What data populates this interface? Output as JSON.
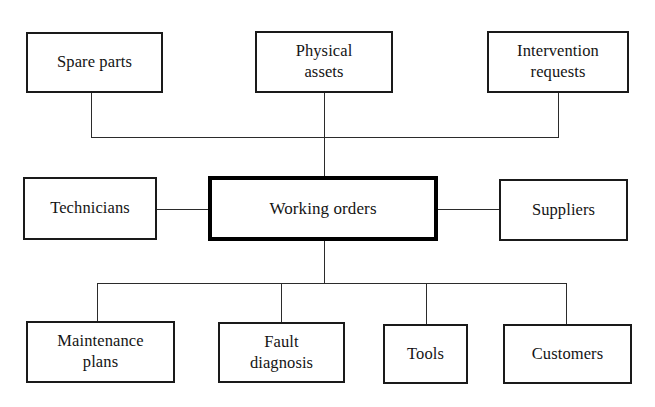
{
  "diagram": {
    "background_color": "#ffffff",
    "line_color": "#2b2b2b",
    "border_color": "#1a1a1a",
    "central_border_color": "#000000",
    "central": {
      "label": "Working orders"
    },
    "nodes": [
      {
        "id": "spare-parts",
        "label": "Spare parts",
        "row": "top"
      },
      {
        "id": "physical-assets",
        "label": "Physical\nassets",
        "row": "top"
      },
      {
        "id": "intervention-requests",
        "label": "Intervention\nrequests",
        "row": "top"
      },
      {
        "id": "technicians",
        "label": "Technicians",
        "row": "middle-left"
      },
      {
        "id": "working-orders",
        "label": "Working orders",
        "row": "middle-center"
      },
      {
        "id": "suppliers",
        "label": "Suppliers",
        "row": "middle-right"
      },
      {
        "id": "maintenance-plans",
        "label": "Maintenance\nplans",
        "row": "bottom"
      },
      {
        "id": "fault-diagnosis",
        "label": "Fault\ndiagnosis",
        "row": "bottom"
      },
      {
        "id": "tools",
        "label": "Tools",
        "row": "bottom"
      },
      {
        "id": "customers",
        "label": "Customers",
        "row": "bottom"
      }
    ],
    "connections": [
      {
        "from": "spare-parts",
        "to": "working-orders"
      },
      {
        "from": "physical-assets",
        "to": "working-orders"
      },
      {
        "from": "intervention-requests",
        "to": "working-orders"
      },
      {
        "from": "technicians",
        "to": "working-orders"
      },
      {
        "from": "suppliers",
        "to": "working-orders"
      },
      {
        "from": "maintenance-plans",
        "to": "working-orders"
      },
      {
        "from": "fault-diagnosis",
        "to": "working-orders"
      },
      {
        "from": "tools",
        "to": "working-orders"
      },
      {
        "from": "customers",
        "to": "working-orders"
      }
    ]
  }
}
